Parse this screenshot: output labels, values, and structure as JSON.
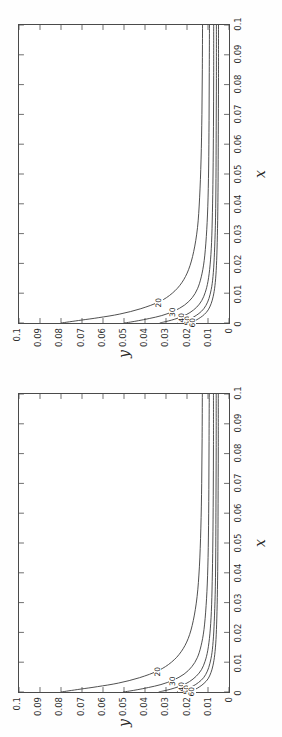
{
  "figure": {
    "background_color": "#ffffff",
    "axis_color": "#4a4a4a",
    "contour_color": "#3a3a3a",
    "orientation_note": "rotated",
    "panels": [
      {
        "id": "unstructured",
        "title": "Unstructured mesh",
        "xlabel": "x",
        "ylabel": "y"
      },
      {
        "id": "structured",
        "title": "Structured mesh",
        "xlabel": "x",
        "ylabel": "y"
      }
    ]
  },
  "axis": {
    "x_ticks": [
      "0",
      "0.01",
      "0.02",
      "0.03",
      "0.04",
      "0.05",
      "0.06",
      "0.07",
      "0.08",
      "0.09",
      "0.1"
    ],
    "y_ticks": [
      "0",
      "0.01",
      "0.02",
      "0.03",
      "0.04",
      "0.05",
      "0.06",
      "0.07",
      "0.08",
      "0.09",
      "0.1"
    ]
  },
  "chart_data": [
    {
      "type": "line",
      "title": "Unstructured mesh",
      "xlabel": "x",
      "ylabel": "y",
      "xlim": [
        0,
        0.1
      ],
      "ylim": [
        0,
        0.1
      ],
      "grid": false,
      "legend": "none",
      "contour_labels": [
        "20",
        "30",
        "40",
        "50",
        "60"
      ],
      "series": [
        {
          "name": "20",
          "label": "20",
          "x": [
            0.0,
            0.0004,
            0.001,
            0.0018,
            0.003,
            0.0048,
            0.0072,
            0.01,
            0.0135,
            0.018,
            0.024,
            0.032,
            0.042,
            0.055,
            0.07,
            0.085,
            0.1
          ],
          "y": [
            0.08,
            0.076,
            0.07,
            0.062,
            0.052,
            0.042,
            0.033,
            0.027,
            0.0225,
            0.0192,
            0.0168,
            0.015,
            0.014,
            0.0133,
            0.0129,
            0.0127,
            0.0126
          ]
        },
        {
          "name": "30",
          "label": "30",
          "x": [
            0.0,
            0.0003,
            0.0008,
            0.0015,
            0.0025,
            0.004,
            0.006,
            0.0085,
            0.0115,
            0.0155,
            0.021,
            0.029,
            0.039,
            0.052,
            0.068,
            0.084,
            0.1
          ],
          "y": [
            0.05,
            0.047,
            0.043,
            0.038,
            0.032,
            0.0262,
            0.0212,
            0.0175,
            0.015,
            0.0132,
            0.0118,
            0.0108,
            0.0101,
            0.0097,
            0.0095,
            0.0094,
            0.0093
          ]
        },
        {
          "name": "40",
          "label": "40",
          "x": [
            0.0,
            0.0003,
            0.0007,
            0.0013,
            0.0022,
            0.0035,
            0.0053,
            0.0075,
            0.0103,
            0.014,
            0.0195,
            0.027,
            0.037,
            0.05,
            0.066,
            0.083,
            0.1
          ],
          "y": [
            0.033,
            0.0312,
            0.0288,
            0.0258,
            0.0222,
            0.0186,
            0.0154,
            0.013,
            0.0113,
            0.01,
            0.009,
            0.0083,
            0.0079,
            0.0076,
            0.0074,
            0.0073,
            0.0073
          ]
        },
        {
          "name": "50",
          "label": "50",
          "x": [
            0.0,
            0.0002,
            0.0006,
            0.0012,
            0.002,
            0.0032,
            0.0048,
            0.007,
            0.0096,
            0.0132,
            0.0185,
            0.0258,
            0.0355,
            0.0485,
            0.0645,
            0.082,
            0.1
          ],
          "y": [
            0.0245,
            0.0232,
            0.0215,
            0.0194,
            0.0169,
            0.0143,
            0.012,
            0.0102,
            0.009,
            0.008,
            0.0073,
            0.0068,
            0.0064,
            0.0062,
            0.0061,
            0.006,
            0.006
          ]
        },
        {
          "name": "60",
          "label": "60",
          "x": [
            0.0,
            0.0002,
            0.0005,
            0.001,
            0.0018,
            0.0029,
            0.0044,
            0.0065,
            0.009,
            0.0125,
            0.0176,
            0.0248,
            0.0344,
            0.0472,
            0.0632,
            0.0812,
            0.1
          ],
          "y": [
            0.0195,
            0.0185,
            0.0172,
            0.0156,
            0.0137,
            0.0117,
            0.0099,
            0.0085,
            0.0075,
            0.0067,
            0.0061,
            0.0057,
            0.0054,
            0.0052,
            0.0051,
            0.005,
            0.005
          ]
        }
      ]
    },
    {
      "type": "line",
      "title": "Structured mesh",
      "xlabel": "x",
      "ylabel": "y",
      "xlim": [
        0,
        0.1
      ],
      "ylim": [
        0,
        0.1
      ],
      "grid": false,
      "legend": "none",
      "contour_labels": [
        "20",
        "30",
        "40",
        "50",
        "60"
      ],
      "series": [
        {
          "name": "20",
          "label": "20",
          "x": [
            0.0,
            0.0004,
            0.001,
            0.0018,
            0.003,
            0.0048,
            0.0072,
            0.01,
            0.0135,
            0.018,
            0.024,
            0.032,
            0.042,
            0.055,
            0.07,
            0.085,
            0.1
          ],
          "y": [
            0.08,
            0.0762,
            0.0704,
            0.0626,
            0.0526,
            0.0426,
            0.0336,
            0.0274,
            0.0228,
            0.0194,
            0.017,
            0.0152,
            0.0141,
            0.0134,
            0.013,
            0.0128,
            0.0127
          ]
        },
        {
          "name": "30",
          "label": "30",
          "x": [
            0.0,
            0.0003,
            0.0008,
            0.0015,
            0.0025,
            0.004,
            0.006,
            0.0085,
            0.0115,
            0.0155,
            0.021,
            0.029,
            0.039,
            0.052,
            0.068,
            0.084,
            0.1
          ],
          "y": [
            0.0505,
            0.0475,
            0.0434,
            0.0384,
            0.0324,
            0.0265,
            0.0214,
            0.0177,
            0.0151,
            0.0133,
            0.0119,
            0.0109,
            0.0102,
            0.0098,
            0.0096,
            0.0095,
            0.0094
          ]
        },
        {
          "name": "40",
          "label": "40",
          "x": [
            0.0,
            0.0003,
            0.0007,
            0.0013,
            0.0022,
            0.0035,
            0.0053,
            0.0075,
            0.0103,
            0.014,
            0.0195,
            0.027,
            0.037,
            0.05,
            0.066,
            0.083,
            0.1
          ],
          "y": [
            0.0335,
            0.0316,
            0.0291,
            0.0261,
            0.0224,
            0.0188,
            0.0156,
            0.0131,
            0.0114,
            0.0101,
            0.0091,
            0.0084,
            0.008,
            0.0077,
            0.0075,
            0.0074,
            0.0074
          ]
        },
        {
          "name": "50",
          "label": "50",
          "x": [
            0.0,
            0.0002,
            0.0006,
            0.0012,
            0.002,
            0.0032,
            0.0048,
            0.007,
            0.0096,
            0.0132,
            0.0185,
            0.0258,
            0.0355,
            0.0485,
            0.0645,
            0.082,
            0.1
          ],
          "y": [
            0.0248,
            0.0235,
            0.0217,
            0.0196,
            0.0171,
            0.0145,
            0.0121,
            0.0103,
            0.0091,
            0.0081,
            0.0074,
            0.0069,
            0.0065,
            0.0063,
            0.0062,
            0.0061,
            0.0061
          ]
        },
        {
          "name": "60",
          "label": "60",
          "x": [
            0.0,
            0.0002,
            0.0005,
            0.001,
            0.0018,
            0.0029,
            0.0044,
            0.0065,
            0.009,
            0.0125,
            0.0176,
            0.0248,
            0.0344,
            0.0472,
            0.0632,
            0.0812,
            0.1
          ],
          "y": [
            0.0198,
            0.0188,
            0.0174,
            0.0158,
            0.0139,
            0.0119,
            0.01,
            0.0086,
            0.0076,
            0.0068,
            0.0062,
            0.0058,
            0.0055,
            0.0053,
            0.0052,
            0.0051,
            0.0051
          ]
        }
      ]
    }
  ]
}
